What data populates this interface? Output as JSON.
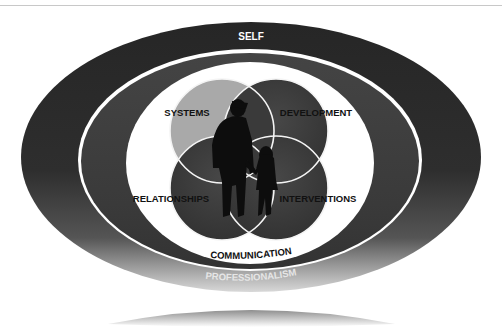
{
  "diagram": {
    "outer_ring": {
      "label": "SELF",
      "color": "#2b2b2b"
    },
    "inner_ring": {
      "label": "PROFESSIONALISM",
      "color": "#3c3c3c"
    },
    "core_ring_label": "COMMUNICATION",
    "circles": [
      {
        "label": "SYSTEMS",
        "color": "#a9a9a9"
      },
      {
        "label": "DEVELOPMENT",
        "color": "#383838"
      },
      {
        "label": "RELATIONSHIPS",
        "color": "#3a3a3a"
      },
      {
        "label": "INTERVENTIONS",
        "color": "#3a3a3a"
      }
    ],
    "center_image": "adult-and-child-silhouette"
  }
}
